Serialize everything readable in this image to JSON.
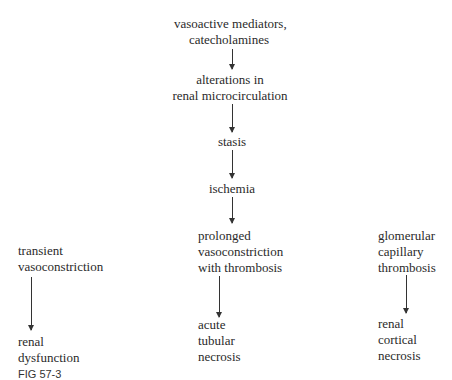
{
  "diagram": {
    "main_chain": [
      {
        "lines": [
          "vasoactive mediators,",
          "catecholamines"
        ]
      },
      {
        "lines": [
          "alterations in",
          "renal microcirculation"
        ]
      },
      {
        "lines": [
          "stasis"
        ]
      },
      {
        "lines": [
          "ischemia"
        ]
      },
      {
        "lines": [
          "prolonged",
          "vasoconstriction",
          "with thrombosis"
        ]
      },
      {
        "lines": [
          "acute",
          "tubular",
          "necrosis"
        ]
      }
    ],
    "left_branch": [
      {
        "lines": [
          "transient",
          "vasoconstriction"
        ]
      },
      {
        "lines": [
          "renal",
          "dysfunction"
        ]
      }
    ],
    "right_branch": [
      {
        "lines": [
          "glomerular",
          "capillary",
          "thrombosis"
        ]
      },
      {
        "lines": [
          "renal",
          "cortical",
          "necrosis"
        ]
      }
    ],
    "caption": "FIG 57-3"
  }
}
